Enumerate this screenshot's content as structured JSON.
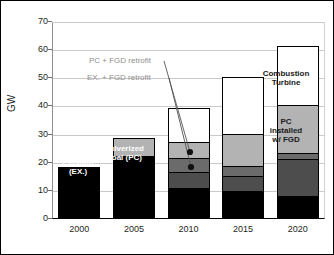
{
  "chart_data": {
    "type": "bar",
    "title": "",
    "subtitle": "",
    "xlabel": "",
    "ylabel": "GW",
    "ylim": [
      0,
      70
    ],
    "ytick_step": 10,
    "grid": true,
    "stacked": true,
    "legend_position": "in-plot annotations",
    "categories": [
      "2000",
      "2005",
      "2010",
      "2015",
      "2020"
    ],
    "yticks": [
      "0",
      "10",
      "20",
      "30",
      "40",
      "50",
      "60",
      "70"
    ],
    "series": [
      {
        "name": "Existing (EX.)",
        "key": "existing",
        "color": "#000000",
        "values": [
          18.3,
          22.0,
          10.5,
          9.5,
          8.0
        ]
      },
      {
        "name": "EX. + FGD retrofit",
        "key": "ex_fgd_retrofit",
        "color": "#4d4d4d",
        "values": [
          0,
          0,
          6.0,
          5.5,
          13.0
        ]
      },
      {
        "name": "PC + FGD retrofit",
        "key": "pc_fgd_retrofit",
        "color": "#6b6b6b",
        "values": [
          0,
          0,
          5.0,
          3.5,
          2.0
        ]
      },
      {
        "name": "PC installed w/ FGD",
        "key": "pc_installed_fgd",
        "color": "#b3b3b3",
        "values": [
          0,
          6.3,
          5.5,
          11.5,
          17.0
        ]
      },
      {
        "name": "Combustion Turbine",
        "key": "combustion_turbine",
        "color": "#ffffff",
        "values": [
          0,
          0,
          12.0,
          20.0,
          21.0
        ]
      }
    ],
    "totals": [
      18.3,
      28.3,
      39.0,
      50.0,
      61.0
    ],
    "annotations": [
      {
        "text": "PC + FGD retrofit",
        "target_category": "2010",
        "target_value": 20.0
      },
      {
        "text": "EX. + FGD retrofit",
        "target_category": "2010",
        "target_value": 14.0
      }
    ],
    "in_bar_labels": [
      {
        "text": "Existing\n(EX.)",
        "line1": "Existing",
        "line2": "(EX.)",
        "category": "2000",
        "series": "Existing (EX.)"
      },
      {
        "text": "Pulverized\nCoal (PC)",
        "line1": "Pulverized",
        "line2": "Coal (PC)",
        "category": "2005",
        "series": "Existing (EX.)"
      },
      {
        "text": "Combustion\nTurbine",
        "line1": "Combustion",
        "line2": "Turbine",
        "category": "2020",
        "series": "Combustion Turbine"
      },
      {
        "text": "PC installed w/ FGD",
        "line1": "PC",
        "line2": "installed",
        "line3": "w/ FGD",
        "category": "2020",
        "series": "PC installed w/ FGD"
      }
    ]
  },
  "axis": {
    "y_title": "GW",
    "y_ticks": [
      "70",
      "60",
      "50",
      "40",
      "30",
      "20",
      "10",
      "0"
    ],
    "x_ticks": [
      "2000",
      "2005",
      "2010",
      "2015",
      "2020"
    ]
  },
  "labels": {
    "existing_l1": "Existing",
    "existing_l2": "(EX.)",
    "pulverized_l1": "Pulverized",
    "pulverized_l2": "Coal (PC)",
    "combustion_l1": "Combustion",
    "combustion_l2": "Turbine",
    "pcfgd_l1": "PC",
    "pcfgd_l2": "installed",
    "pcfgd_l3": "w/ FGD",
    "anno_pc_fgd": "PC + FGD retrofit",
    "anno_ex_fgd": "EX. + FGD retrofit"
  },
  "colors": {
    "existing": "#000000",
    "ex_fgd_retrofit": "#4d4d4d",
    "pc_fgd_retrofit": "#6b6b6b",
    "pc_installed_fgd": "#b3b3b3",
    "combustion_turbine": "#ffffff",
    "grid": "#c9c9c9",
    "axis": "#000000",
    "annotation_text": "#8f8f8f"
  }
}
